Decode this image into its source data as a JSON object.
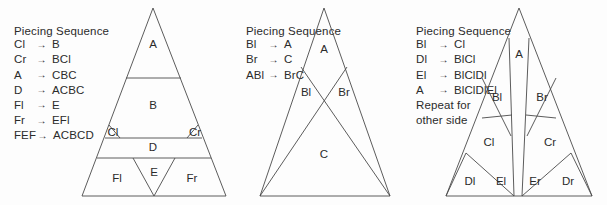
{
  "figure": {
    "background_color": "#fdfdfd",
    "line_color": "#4a4a4a",
    "text_color": "#2b2b2b"
  },
  "panels": [
    {
      "id": "panel-1",
      "legend": {
        "title": "Piecing Sequence",
        "rows": [
          {
            "lhs": "Cl",
            "arrow": "→",
            "rhs": "B"
          },
          {
            "lhs": "Cr",
            "arrow": "→",
            "rhs": "BCl"
          },
          {
            "lhs": "A",
            "arrow": "→",
            "rhs": "CBC"
          },
          {
            "lhs": "D",
            "arrow": "→",
            "rhs": "ACBC"
          },
          {
            "lhs": "Fl",
            "arrow": "→",
            "rhs": "E"
          },
          {
            "lhs": "Fr",
            "arrow": "→",
            "rhs": "EFl"
          },
          {
            "lhs": "FEF",
            "arrow": "→",
            "rhs": "ACBCD"
          }
        ],
        "notes": []
      },
      "triangle_labels": [
        "A",
        "B",
        "Cl",
        "Cr",
        "D",
        "Fl",
        "E",
        "Fr"
      ]
    },
    {
      "id": "panel-2",
      "legend": {
        "title": "Piecing Sequence",
        "rows": [
          {
            "lhs": "Bl",
            "arrow": "→",
            "rhs": "A"
          },
          {
            "lhs": "Br",
            "arrow": "→",
            "rhs": "C"
          },
          {
            "lhs": "ABl",
            "arrow": "→",
            "rhs": "BrC"
          }
        ],
        "notes": []
      },
      "triangle_labels": [
        "A",
        "Bl",
        "Br",
        "C"
      ]
    },
    {
      "id": "panel-3",
      "legend": {
        "title": "Piecing Sequence",
        "rows": [
          {
            "lhs": "Bl",
            "arrow": "→",
            "rhs": "Cl"
          },
          {
            "lhs": "Dl",
            "arrow": "→",
            "rhs": "BlCl"
          },
          {
            "lhs": "El",
            "arrow": "→",
            "rhs": "BlClDl"
          },
          {
            "lhs": "A",
            "arrow": "→",
            "rhs": "BlClDlEl"
          }
        ],
        "notes": [
          "Repeat for",
          "other side"
        ]
      },
      "triangle_labels": [
        "A",
        "Bl",
        "Br",
        "Cl",
        "Cr",
        "Dl",
        "El",
        "Er",
        "Dr"
      ]
    }
  ]
}
